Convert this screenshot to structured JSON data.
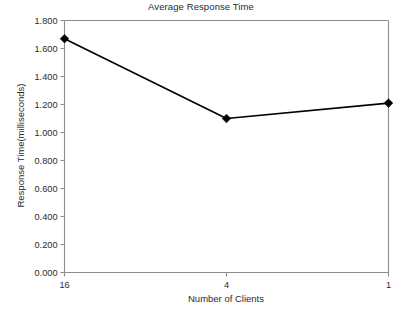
{
  "chart_data": {
    "type": "line",
    "title": "Average Response Time",
    "xlabel": "Number of Clients",
    "ylabel": "Response Time(milliseconds)",
    "categories": [
      "16",
      "4",
      "1"
    ],
    "values": [
      1.67,
      1.1,
      1.21
    ],
    "series": [
      {
        "name": "Average Response Time",
        "values": [
          1.67,
          1.1,
          1.21
        ]
      }
    ],
    "ylim": [
      0.0,
      1.8
    ],
    "ytick_labels": [
      "0.000",
      "0.200",
      "0.400",
      "0.600",
      "0.800",
      "1.000",
      "1.200",
      "1.400",
      "1.600",
      "1.800"
    ],
    "ytick_values": [
      0.0,
      0.2,
      0.4,
      0.6,
      0.8,
      1.0,
      1.2,
      1.4,
      1.6,
      1.8
    ],
    "xtick_labels": [
      "16",
      "4",
      "1"
    ],
    "grid": false,
    "legend": "none",
    "marker": "diamond",
    "line_color": "#000000",
    "marker_color": "#000000",
    "axis_color": "#8c8c8c",
    "text_color": "#2b2b2b",
    "background_color": "#ffffff"
  }
}
